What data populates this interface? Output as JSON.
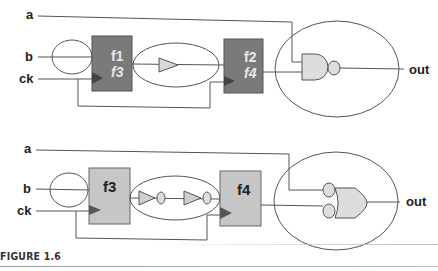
{
  "colors": {
    "line": "#555555",
    "dark_box": "#7a7a7a",
    "light_box": "#c6c6c6",
    "gate_fill": "#dddddd",
    "text": "#222222"
  },
  "top_circuit": {
    "inputs": {
      "a": "a",
      "b": "b",
      "ck": "ck"
    },
    "register1": {
      "line1": "f1",
      "line2": "f3"
    },
    "register2": {
      "line1": "f2",
      "line2": "f4"
    },
    "logic_cloud": "buffer",
    "output_gate": "nand",
    "output": "out"
  },
  "bottom_circuit": {
    "inputs": {
      "a": "a",
      "b": "b",
      "ck": "ck"
    },
    "register1": {
      "label": "f3"
    },
    "register2": {
      "label": "f4"
    },
    "logic_cloud": "two inverters",
    "output_gate": "or with inverted inputs",
    "output": "out"
  },
  "caption": "FIGURE 1.6"
}
